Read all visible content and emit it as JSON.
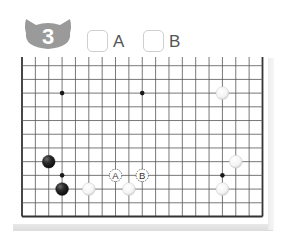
{
  "problem": {
    "number": "3",
    "badge_icon": "cat-head-icon",
    "badge_color": "#9a9a9a",
    "choices": [
      {
        "label": "A",
        "checked": false
      },
      {
        "label": "B",
        "checked": false
      }
    ]
  },
  "board": {
    "columns": 19,
    "rows": 12,
    "open_edge": "top",
    "line_color": "#555555",
    "edge_color": "#333333",
    "star_points": [
      {
        "col": 3,
        "row": 2
      },
      {
        "col": 9,
        "row": 2
      },
      {
        "col": 3,
        "row": 8
      },
      {
        "col": 15,
        "row": 8
      }
    ],
    "stones": [
      {
        "color": "white",
        "col": 15,
        "row": 2
      },
      {
        "color": "black",
        "col": 2,
        "row": 7
      },
      {
        "color": "white",
        "col": 16,
        "row": 7
      },
      {
        "color": "black",
        "col": 3,
        "row": 9
      },
      {
        "color": "white",
        "col": 5,
        "row": 9
      },
      {
        "color": "white",
        "col": 8,
        "row": 9
      },
      {
        "color": "white",
        "col": 15,
        "row": 9
      }
    ],
    "markers": [
      {
        "label": "A",
        "col": 7,
        "row": 8
      },
      {
        "label": "B",
        "col": 9,
        "row": 8
      }
    ]
  }
}
